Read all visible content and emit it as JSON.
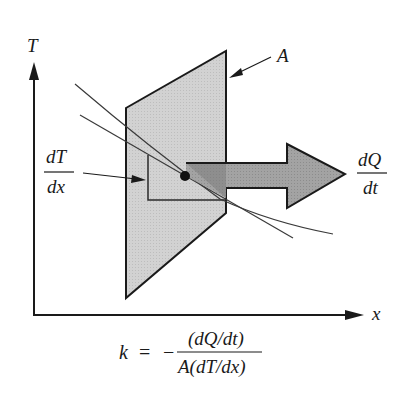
{
  "diagram": {
    "axes": {
      "y_label": "T",
      "x_label": "x"
    },
    "labels": {
      "area": "A",
      "gradient_num": "dT",
      "gradient_den": "dx",
      "heat_rate_num": "dQ",
      "heat_rate_den": "dt"
    },
    "formula": {
      "lhs": "k",
      "equals": "=",
      "sign": "−",
      "numerator": "(dQ/dt)",
      "denominator": "A(dT/dx)"
    },
    "colors": {
      "plane_fill": "#cfcfcf",
      "arrow_fill": "#9a9a9a",
      "arrow_shadow": "#7a7a7a",
      "stroke": "#1a1a1a",
      "curve": "#3a3a3a"
    }
  }
}
